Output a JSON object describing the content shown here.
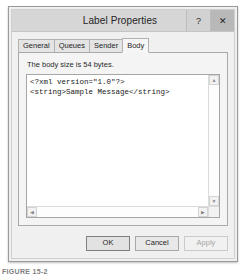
{
  "window": {
    "title": "Label Properties",
    "caption_buttons": [
      {
        "name": "help",
        "glyph": "?"
      },
      {
        "name": "close",
        "glyph": "✕"
      }
    ]
  },
  "tabs": [
    {
      "label": "General",
      "active": false
    },
    {
      "label": "Queues",
      "active": false
    },
    {
      "label": "Sender",
      "active": false
    },
    {
      "label": "Body",
      "active": true
    }
  ],
  "body_tab": {
    "size_label": "The body size is 54 bytes.",
    "editor_text": "<?xml version=\"1.0\"?>\n<string>Sample Message</string>"
  },
  "scrollbars": {
    "vertical": {
      "up_glyph": "▲",
      "down_glyph": "▼"
    },
    "horizontal": {
      "left_glyph": "◀",
      "right_glyph": "▶"
    }
  },
  "footer": {
    "ok_label": "OK",
    "cancel_label": "Cancel",
    "apply_label": "Apply"
  },
  "figure": {
    "caption": "FIGURE 15-2"
  }
}
